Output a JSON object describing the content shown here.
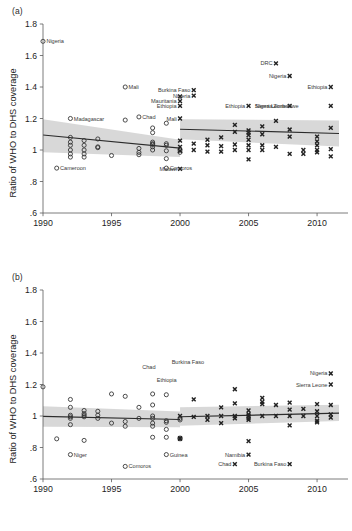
{
  "figure": {
    "panels": [
      {
        "tag": "(a)",
        "ylabel": "Ratio of WHO to DHS coverage"
      },
      {
        "tag": "(b)",
        "ylabel": "Ratio of WHO to DHS coverage"
      }
    ]
  },
  "axis": {
    "ytick_labels": [
      "1.8",
      "1.6",
      "1.4",
      "1.2",
      "1",
      ".8",
      ".6"
    ],
    "ytick_values": [
      1.8,
      1.6,
      1.4,
      1.2,
      1.0,
      0.8,
      0.6
    ],
    "xtick_labels": [
      "1990",
      "1995",
      "2000",
      "2005",
      "2010"
    ],
    "xtick_values": [
      1990,
      1995,
      2000,
      2005,
      2010
    ]
  },
  "chart_data": [
    {
      "type": "scatter",
      "panel": "(a)",
      "title": "",
      "xlabel": "",
      "ylabel": "Ratio of WHO to DHS coverage",
      "xlim": [
        1990,
        2011.6
      ],
      "ylim": [
        0.6,
        1.8
      ],
      "grid": false,
      "legend": "none",
      "series": [
        {
          "name": "pre-2000 (open circle)",
          "marker": "open-circle",
          "points": [
            [
              1990,
              1.69
            ],
            [
              1991,
              0.885
            ],
            [
              1992,
              1.2
            ],
            [
              1992,
              1.08
            ],
            [
              1992,
              1.05
            ],
            [
              1992,
              1.03
            ],
            [
              1992,
              1.0
            ],
            [
              1992,
              0.975
            ],
            [
              1992,
              0.955
            ],
            [
              1993,
              1.06
            ],
            [
              1993,
              1.03
            ],
            [
              1993,
              1.0
            ],
            [
              1993,
              0.975
            ],
            [
              1993,
              0.955
            ],
            [
              1994,
              1.07
            ],
            [
              1994,
              1.02
            ],
            [
              1994,
              1.015
            ],
            [
              1995,
              0.965
            ],
            [
              1996,
              1.4
            ],
            [
              1996,
              1.19
            ],
            [
              1997,
              1.21
            ],
            [
              1997,
              1.01
            ],
            [
              1997,
              0.985
            ],
            [
              1997,
              0.97
            ],
            [
              1998,
              1.14
            ],
            [
              1998,
              1.11
            ],
            [
              1998,
              1.05
            ],
            [
              1998,
              1.04
            ],
            [
              1998,
              1.035
            ],
            [
              1998,
              1.02
            ],
            [
              1998,
              1.0
            ],
            [
              1999,
              1.17
            ],
            [
              1999,
              1.04
            ],
            [
              1999,
              1.03
            ],
            [
              1999,
              0.995
            ],
            [
              1999,
              0.945
            ],
            [
              1999,
              0.885
            ],
            [
              2000,
              1.0
            ],
            [
              2000,
              0.985
            ]
          ]
        },
        {
          "name": "post-2000 (x marker)",
          "marker": "x",
          "points": [
            [
              2000,
              1.2
            ],
            [
              2000,
              1.28
            ],
            [
              2000,
              1.31
            ],
            [
              2000,
              1.34
            ],
            [
              2000,
              1.06
            ],
            [
              2000,
              1.02
            ],
            [
              2000,
              0.995
            ],
            [
              2000,
              0.88
            ],
            [
              2001,
              1.38
            ],
            [
              2001,
              1.345
            ],
            [
              2001,
              1.04
            ],
            [
              2001,
              1.0
            ],
            [
              2002,
              1.065
            ],
            [
              2002,
              1.03
            ],
            [
              2002,
              0.99
            ],
            [
              2003,
              1.08
            ],
            [
              2003,
              1.025
            ],
            [
              2003,
              0.99
            ],
            [
              2004,
              1.16
            ],
            [
              2004,
              1.115
            ],
            [
              2004,
              1.035
            ],
            [
              2004,
              1.0
            ],
            [
              2005,
              1.28
            ],
            [
              2005,
              1.125
            ],
            [
              2005,
              1.11
            ],
            [
              2005,
              1.095
            ],
            [
              2005,
              1.065
            ],
            [
              2005,
              1.03
            ],
            [
              2005,
              1.0
            ],
            [
              2005,
              0.94
            ],
            [
              2006,
              1.15
            ],
            [
              2006,
              1.1
            ],
            [
              2006,
              1.03
            ],
            [
              2006,
              1.0
            ],
            [
              2007,
              1.55
            ],
            [
              2007,
              1.185
            ],
            [
              2007,
              1.02
            ],
            [
              2008,
              1.47
            ],
            [
              2008,
              1.28
            ],
            [
              2008,
              1.13
            ],
            [
              2008,
              1.085
            ],
            [
              2008,
              0.975
            ],
            [
              2009,
              1.0
            ],
            [
              2009,
              0.975
            ],
            [
              2010,
              1.085
            ],
            [
              2010,
              1.055
            ],
            [
              2010,
              1.03
            ],
            [
              2010,
              1.0
            ],
            [
              2010,
              0.985
            ],
            [
              2011,
              1.4
            ],
            [
              2011,
              1.28
            ],
            [
              2011,
              1.14
            ],
            [
              2011,
              1.005
            ],
            [
              2011,
              0.96
            ]
          ]
        }
      ],
      "fit_lines": [
        {
          "name": "pre-2000 fit",
          "x": [
            1990,
            2000
          ],
          "y": [
            1.095,
            1.012
          ],
          "ci_upper": [
            1.195,
            1.065
          ],
          "ci_lower": [
            0.985,
            0.955
          ]
        },
        {
          "name": "post-2000 fit",
          "x": [
            2000,
            2011.6
          ],
          "y": [
            1.132,
            1.105
          ],
          "ci_upper": [
            1.195,
            1.188
          ],
          "ci_lower": [
            1.068,
            1.022
          ]
        }
      ],
      "annotations": [
        {
          "label": "Nigeria",
          "x": 1990,
          "y": 1.69,
          "marker": "open-circle",
          "side": "right"
        },
        {
          "label": "Madagascar",
          "x": 1992,
          "y": 1.2,
          "marker": "open-circle",
          "side": "right"
        },
        {
          "label": "Cameroon",
          "x": 1991,
          "y": 0.885,
          "marker": "open-circle",
          "side": "right"
        },
        {
          "label": "Mali",
          "x": 1996,
          "y": 1.4,
          "marker": "open-circle",
          "side": "right"
        },
        {
          "label": "Chad",
          "x": 1997,
          "y": 1.21,
          "marker": "open-circle",
          "side": "right"
        },
        {
          "label": "Comoros",
          "x": 1999,
          "y": 0.885,
          "marker": "open-circle",
          "side": "right"
        },
        {
          "label": "Mauritania",
          "x": 2000,
          "y": 1.31,
          "marker": "x",
          "side": "left"
        },
        {
          "label": "Ethiopia",
          "x": 2000,
          "y": 1.28,
          "marker": "x",
          "side": "left"
        },
        {
          "label": "Mali",
          "x": 2000,
          "y": 1.2,
          "marker": "x",
          "side": "left"
        },
        {
          "label": "Malawi",
          "x": 2000,
          "y": 0.88,
          "marker": "x",
          "side": "left"
        },
        {
          "label": "Burkina Faso",
          "x": 2001,
          "y": 1.38,
          "marker": "x",
          "side": "left"
        },
        {
          "label": "Nigeria",
          "x": 2001,
          "y": 1.345,
          "marker": "x",
          "side": "left"
        },
        {
          "label": "Ethiopia",
          "x": 2005,
          "y": 1.28,
          "marker": "x",
          "side": "left"
        },
        {
          "label": "Nigeria",
          "x": 2007,
          "y": 1.28,
          "marker": "x",
          "side": "left"
        },
        {
          "label": "Sierra Leone",
          "x": 2008,
          "y": 1.28,
          "marker": "x",
          "side": "left"
        },
        {
          "label": "Zimbabwe",
          "x": 2008.9,
          "y": 1.28,
          "marker": "x",
          "side": "left"
        },
        {
          "label": "DRC",
          "x": 2007,
          "y": 1.55,
          "marker": "x",
          "side": "left"
        },
        {
          "label": "Nigeria",
          "x": 2008,
          "y": 1.47,
          "marker": "x",
          "side": "left"
        },
        {
          "label": "Ethiopia",
          "x": 2011,
          "y": 1.4,
          "marker": "x",
          "side": "left"
        }
      ]
    },
    {
      "type": "scatter",
      "panel": "(b)",
      "title": "",
      "xlabel": "",
      "ylabel": "Ratio of WHO to DHS coverage",
      "xlim": [
        1990,
        2011.6
      ],
      "ylim": [
        0.6,
        1.8
      ],
      "grid": false,
      "legend": "none",
      "series": [
        {
          "name": "pre-2000 (open circle)",
          "marker": "open-circle",
          "points": [
            [
              1990,
              1.185
            ],
            [
              1991,
              0.855
            ],
            [
              1992,
              1.105
            ],
            [
              1992,
              1.055
            ],
            [
              1992,
              1.005
            ],
            [
              1992,
              0.995
            ],
            [
              1992,
              0.985
            ],
            [
              1992,
              0.945
            ],
            [
              1992,
              0.755
            ],
            [
              1993,
              1.035
            ],
            [
              1993,
              1.015
            ],
            [
              1993,
              1.005
            ],
            [
              1993,
              0.995
            ],
            [
              1993,
              0.845
            ],
            [
              1994,
              1.03
            ],
            [
              1994,
              1.005
            ],
            [
              1994,
              0.985
            ],
            [
              1995,
              1.14
            ],
            [
              1995,
              0.955
            ],
            [
              1996,
              1.125
            ],
            [
              1996,
              0.965
            ],
            [
              1996,
              0.935
            ],
            [
              1996,
              0.68
            ],
            [
              1997,
              1.055
            ],
            [
              1997,
              0.985
            ],
            [
              1998,
              1.14
            ],
            [
              1998,
              1.07
            ],
            [
              1998,
              1.0
            ],
            [
              1998,
              0.985
            ],
            [
              1998,
              0.955
            ],
            [
              1998,
              0.935
            ],
            [
              1998,
              0.865
            ],
            [
              1999,
              1.135
            ],
            [
              1999,
              0.97
            ],
            [
              1999,
              0.96
            ],
            [
              1999,
              0.915
            ],
            [
              1999,
              0.865
            ],
            [
              1999,
              0.755
            ],
            [
              2000,
              0.985
            ],
            [
              2000,
              0.975
            ],
            [
              2000,
              0.86
            ],
            [
              2000,
              0.855
            ]
          ]
        },
        {
          "name": "post-2000 (x marker)",
          "marker": "x",
          "points": [
            [
              2000,
              1.0
            ],
            [
              2000,
              0.86
            ],
            [
              2000,
              0.855
            ],
            [
              2001,
              1.105
            ],
            [
              2001,
              0.995
            ],
            [
              2002,
              1.0
            ],
            [
              2002,
              0.975
            ],
            [
              2003,
              1.055
            ],
            [
              2003,
              1.0
            ],
            [
              2003,
              0.955
            ],
            [
              2004,
              1.17
            ],
            [
              2004,
              1.08
            ],
            [
              2004,
              1.0
            ],
            [
              2004,
              0.985
            ],
            [
              2004,
              0.695
            ],
            [
              2005,
              1.035
            ],
            [
              2005,
              1.01
            ],
            [
              2005,
              1.0
            ],
            [
              2005,
              0.985
            ],
            [
              2005,
              0.975
            ],
            [
              2005,
              0.84
            ],
            [
              2005,
              0.755
            ],
            [
              2006,
              1.115
            ],
            [
              2006,
              1.09
            ],
            [
              2006,
              1.075
            ],
            [
              2006,
              1.0
            ],
            [
              2007,
              1.07
            ],
            [
              2007,
              1.0
            ],
            [
              2008,
              1.085
            ],
            [
              2008,
              1.04
            ],
            [
              2008,
              1.0
            ],
            [
              2008,
              0.94
            ],
            [
              2008,
              0.695
            ],
            [
              2009,
              1.045
            ],
            [
              2009,
              1.0
            ],
            [
              2010,
              1.075
            ],
            [
              2010,
              1.03
            ],
            [
              2010,
              1.0
            ],
            [
              2010,
              0.97
            ],
            [
              2010,
              0.96
            ],
            [
              2011,
              1.27
            ],
            [
              2011,
              1.2
            ],
            [
              2011,
              1.07
            ],
            [
              2011,
              1.01
            ],
            [
              2011,
              0.99
            ]
          ]
        }
      ],
      "fit_lines": [
        {
          "name": "pre-2000 fit",
          "x": [
            1990,
            2000
          ],
          "y": [
            0.998,
            0.978
          ],
          "ci_upper": [
            1.062,
            1.028
          ],
          "ci_lower": [
            0.932,
            0.928
          ]
        },
        {
          "name": "post-2000 fit",
          "x": [
            2000,
            2011.6
          ],
          "y": [
            0.995,
            1.018
          ],
          "ci_upper": [
            1.055,
            1.072
          ],
          "ci_lower": [
            0.938,
            0.968
          ]
        }
      ],
      "annotations": [
        {
          "label": "Chad",
          "x": 1997,
          "y": 1.31,
          "marker": "open-circle",
          "side": "right"
        },
        {
          "label": "Niger",
          "x": 1992,
          "y": 0.755,
          "marker": "open-circle",
          "side": "right"
        },
        {
          "label": "Comoros",
          "x": 1996,
          "y": 0.68,
          "marker": "open-circle",
          "side": "right"
        },
        {
          "label": "Guinea",
          "x": 1999,
          "y": 0.755,
          "marker": "open-circle",
          "side": "right"
        },
        {
          "label": "Ethiopia",
          "x": 2000,
          "y": 1.23,
          "marker": "x",
          "side": "left"
        },
        {
          "label": "Burkina Faso",
          "x": 2002,
          "y": 1.34,
          "marker": "x",
          "side": "left"
        },
        {
          "label": "Chad",
          "x": 2004,
          "y": 0.695,
          "marker": "x",
          "side": "left"
        },
        {
          "label": "Namibia",
          "x": 2005,
          "y": 0.755,
          "marker": "x",
          "side": "left"
        },
        {
          "label": "Burkina Faso",
          "x": 2008,
          "y": 0.695,
          "marker": "x",
          "side": "left"
        },
        {
          "label": "Nigeria",
          "x": 2011,
          "y": 1.27,
          "marker": "x",
          "side": "left"
        },
        {
          "label": "Sierra Leone",
          "x": 2011,
          "y": 1.2,
          "marker": "x",
          "side": "left"
        }
      ]
    }
  ]
}
